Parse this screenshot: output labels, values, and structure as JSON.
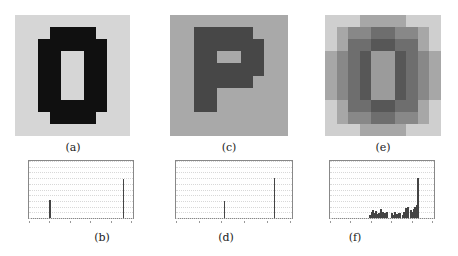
{
  "figure": {
    "panels": [
      {
        "id": "a",
        "caption": "(a)",
        "description": "Binary pixel image of digit 0",
        "bg": "#d6d6d6",
        "fg": "#101010"
      },
      {
        "id": "c",
        "caption": "(c)",
        "description": "Two-tone pixel image of letter P",
        "bg": "#a9a9a9",
        "fg": "#474747"
      },
      {
        "id": "e",
        "caption": "(e)",
        "description": "Blurred pixel image of digit 0"
      }
    ],
    "histograms": [
      {
        "id": "b",
        "caption": "(b)"
      },
      {
        "id": "d",
        "caption": "(d)"
      },
      {
        "id": "f",
        "caption": "(f)"
      }
    ]
  },
  "chart_data": [
    {
      "type": "bar",
      "id": "b",
      "title": "",
      "caption": "(b)",
      "xlabel": "",
      "ylabel": "",
      "xlim": [
        0,
        255
      ],
      "ylim": [
        0,
        100
      ],
      "x_ticks": [
        0,
        50,
        100,
        150,
        200,
        250
      ],
      "y_ticks": [
        0,
        10,
        20,
        30,
        40,
        50,
        60,
        70,
        80,
        90,
        100
      ],
      "grid": true,
      "x": [
        50,
        230
      ],
      "values": [
        32,
        68
      ]
    },
    {
      "type": "bar",
      "id": "d",
      "title": "",
      "caption": "(d)",
      "xlabel": "",
      "ylabel": "",
      "xlim": [
        0,
        255
      ],
      "ylim": [
        0,
        100
      ],
      "x_ticks": [
        0,
        50,
        100,
        150,
        200,
        250
      ],
      "y_ticks": [
        0,
        10,
        20,
        30,
        40,
        50,
        60,
        70,
        80,
        90,
        100
      ],
      "grid": true,
      "x": [
        105,
        215
      ],
      "values": [
        30,
        70
      ]
    },
    {
      "type": "bar",
      "id": "f",
      "title": "",
      "caption": "(f)",
      "xlabel": "",
      "ylabel": "",
      "xlim": [
        0,
        255
      ],
      "ylim": [
        0,
        100
      ],
      "x_ticks": [
        0,
        50,
        100,
        150,
        200,
        250
      ],
      "y_ticks": [
        0,
        10,
        20,
        30,
        40,
        50,
        60,
        70,
        80,
        90,
        100
      ],
      "grid": true,
      "x": [
        95,
        100,
        103,
        106,
        110,
        115,
        118,
        122,
        127,
        133,
        138,
        150,
        153,
        157,
        162,
        166,
        170,
        176,
        180,
        184,
        187,
        190,
        196,
        200,
        203,
        206,
        210,
        214
      ],
      "values": [
        6,
        10,
        14,
        8,
        12,
        7,
        9,
        15,
        10,
        8,
        11,
        9,
        6,
        10,
        7,
        9,
        8,
        6,
        10,
        18,
        12,
        20,
        14,
        10,
        16,
        20,
        22,
        70
      ]
    }
  ]
}
